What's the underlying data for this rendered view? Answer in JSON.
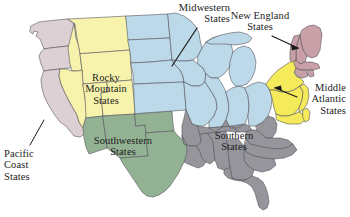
{
  "map": {
    "title": "United States Regions Map",
    "background_color": "#ffffff",
    "border_color": "#4a4a4a",
    "labels": [
      {
        "id": "midwestern",
        "name": "Midwestern States",
        "line1": "Midwestern",
        "line2": "States",
        "align": "right",
        "has_leader": true,
        "leader_style": "line"
      },
      {
        "id": "new_england",
        "name": "New England States",
        "line1": "New England",
        "line2": "States",
        "align": "center",
        "has_leader": true,
        "leader_style": "arrow"
      },
      {
        "id": "middle_atlantic",
        "name": "Middle Atlantic States",
        "line1": "Middle",
        "line2": "Atlantic",
        "line3": "States",
        "align": "right",
        "has_leader": true,
        "leader_style": "arrow"
      },
      {
        "id": "southern",
        "name": "Southern States",
        "line1": "Southern",
        "line2": "States",
        "align": "center",
        "has_leader": false
      },
      {
        "id": "southwestern",
        "name": "Southwestern States",
        "line1": "Southwestern",
        "line2": "States",
        "align": "center",
        "has_leader": false
      },
      {
        "id": "rocky_mountain",
        "name": "Rocky Mountain States",
        "line1": "Rocky",
        "line2": "Mountain",
        "line3": "States",
        "align": "center",
        "has_leader": false
      },
      {
        "id": "pacific_coast",
        "name": "Pacific Coast States",
        "line1": "Pacific",
        "line2": "Coast",
        "line3": "States",
        "align": "left",
        "has_leader": true,
        "leader_style": "line"
      }
    ],
    "regions": [
      {
        "id": "pacific_coast",
        "name": "Pacific Coast States",
        "color": "#ddd0d4",
        "states": [
          "Washington",
          "Oregon",
          "California"
        ]
      },
      {
        "id": "rocky_mountain",
        "name": "Rocky Mountain States",
        "color": "#f8f3ac",
        "states": [
          "Idaho",
          "Montana",
          "Wyoming",
          "Nevada",
          "Utah",
          "Colorado"
        ]
      },
      {
        "id": "southwestern",
        "name": "Southwestern States",
        "color": "#93b193",
        "states": [
          "Arizona",
          "New Mexico",
          "Texas",
          "Oklahoma"
        ]
      },
      {
        "id": "midwestern",
        "name": "Midwestern States",
        "color": "#bcd9ea",
        "states": [
          "North Dakota",
          "South Dakota",
          "Nebraska",
          "Kansas",
          "Minnesota",
          "Iowa",
          "Missouri",
          "Wisconsin",
          "Illinois",
          "Indiana",
          "Michigan",
          "Ohio"
        ]
      },
      {
        "id": "southern",
        "name": "Southern States",
        "color": "#95959b",
        "states": [
          "Kentucky",
          "Tennessee",
          "Arkansas",
          "Louisiana",
          "Mississippi",
          "Alabama",
          "Georgia",
          "Florida",
          "South Carolina",
          "North Carolina",
          "Virginia",
          "West Virginia"
        ]
      },
      {
        "id": "middle_atlantic",
        "name": "Middle Atlantic States",
        "color": "#f5ea5a",
        "states": [
          "New York",
          "Pennsylvania",
          "New Jersey",
          "Maryland",
          "Delaware"
        ]
      },
      {
        "id": "new_england",
        "name": "New England States",
        "color": "#c9a0a8",
        "states": [
          "Maine",
          "New Hampshire",
          "Vermont",
          "Massachusetts",
          "Connecticut",
          "Rhode Island"
        ]
      }
    ]
  }
}
